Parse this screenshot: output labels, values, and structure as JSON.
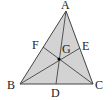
{
  "diagram": {
    "fill_color": "#d3d3d3",
    "stroke_color": "#444444",
    "points": {
      "A": {
        "label": "A",
        "x": 66,
        "y": 11
      },
      "B": {
        "label": "B",
        "x": 20,
        "y": 84
      },
      "C": {
        "label": "C",
        "x": 93,
        "y": 84
      },
      "D": {
        "label": "D",
        "x": 56,
        "y": 84
      },
      "E": {
        "label": "E",
        "x": 80,
        "y": 48
      },
      "F": {
        "label": "F",
        "x": 43,
        "y": 47
      },
      "G": {
        "label": "G",
        "x": 59,
        "y": 59
      }
    },
    "segments": [
      "AB",
      "BC",
      "CA",
      "AD",
      "BE",
      "CF"
    ]
  }
}
